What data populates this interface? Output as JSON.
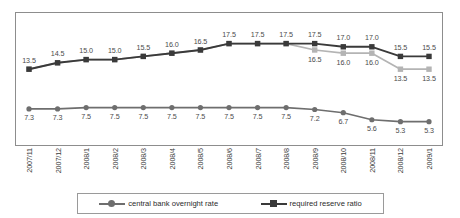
{
  "chart_data": {
    "type": "line",
    "title": "",
    "subtitle": "",
    "xlabel": "",
    "ylabel": "",
    "grid": false,
    "legend_position": "bottom",
    "ylim": [
      4.0,
      19.0
    ],
    "categories": [
      "2007/11",
      "2007/12",
      "2008/1",
      "2008/2",
      "2008/3",
      "2008/4",
      "2008/5",
      "2008/6",
      "2008/7",
      "2008/8",
      "2008/9",
      "2008/10",
      "2008/11",
      "2008/12",
      "2009/1"
    ],
    "series": [
      {
        "name": "central bank overnight rate",
        "marker": "circle",
        "color": "#6e6e6e",
        "values": [
          7.3,
          7.3,
          7.5,
          7.5,
          7.5,
          7.5,
          7.5,
          7.5,
          7.5,
          7.5,
          7.2,
          6.7,
          5.6,
          5.3,
          5.3
        ],
        "labels": [
          "7.3",
          "7.3",
          "7.5",
          "7.5",
          "7.5",
          "7.5",
          "7.5",
          "7.5",
          "7.5",
          "7.5",
          "7.2",
          "6.7",
          "5.6",
          "5.3",
          "5.3"
        ],
        "label_position": "below"
      },
      {
        "name": "required reserve ratio",
        "marker": "square",
        "color": "#3a3a3a",
        "values": [
          13.5,
          14.5,
          15.0,
          15.0,
          15.5,
          16.0,
          16.5,
          17.5,
          17.5,
          17.5,
          17.5,
          17.0,
          17.0,
          15.5,
          15.5
        ],
        "labels": [
          "13.5",
          "14.5",
          "15.0",
          "15.0",
          "15.5",
          "16.0",
          "16.5",
          "17.5",
          "17.5",
          "17.5",
          "17.5",
          "17.0",
          "17.0",
          "15.5",
          "15.5"
        ],
        "label_position": "above"
      },
      {
        "name": "required reserve ratio (small institutions)",
        "marker": "square",
        "color": "#b4b4b4",
        "values": [
          13.5,
          14.5,
          15.0,
          15.0,
          15.5,
          16.0,
          16.5,
          17.5,
          17.5,
          17.5,
          16.5,
          16.0,
          16.0,
          13.5,
          13.5
        ],
        "labels": [
          "",
          "",
          "",
          "",
          "",
          "",
          "",
          "",
          "",
          "",
          "16.5",
          "16.0",
          "16.0",
          "13.5",
          "13.5"
        ],
        "label_position": "below"
      }
    ]
  },
  "legend": {
    "entries": [
      {
        "label": "central bank overnight rate",
        "marker": "circle",
        "color": "#6e6e6e"
      },
      {
        "label": "required reserve ratio",
        "marker": "square",
        "color": "#3a3a3a"
      }
    ]
  }
}
